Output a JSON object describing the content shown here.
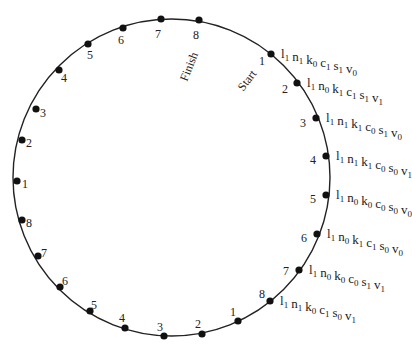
{
  "diagram": {
    "type": "circular-state-sequence",
    "circle": {
      "cx": 171.5,
      "cy": 177.5,
      "r": 158.5,
      "stroke": "#222222"
    },
    "dot_color": "#111111",
    "markers": [
      {
        "text": "Finish",
        "x": 190,
        "y": 67,
        "angle": -68
      },
      {
        "text": "Start",
        "x": 248,
        "y": 81,
        "angle": -52
      }
    ],
    "right_points": [
      {
        "num": "1",
        "x": 271,
        "y": 54,
        "nx": 262,
        "ny": 62,
        "state": [
          [
            "l",
            "1"
          ],
          [
            "n",
            "1"
          ],
          [
            "k",
            "0"
          ],
          [
            "c",
            "1"
          ],
          [
            "s",
            "1"
          ],
          [
            "v",
            "0"
          ]
        ]
      },
      {
        "num": "2",
        "x": 297,
        "y": 83,
        "nx": 285,
        "ny": 90,
        "state": [
          [
            "l",
            "1"
          ],
          [
            "n",
            "0"
          ],
          [
            "k",
            "1"
          ],
          [
            "c",
            "1"
          ],
          [
            "s",
            "1"
          ],
          [
            "v",
            "1"
          ]
        ]
      },
      {
        "num": "3",
        "x": 316,
        "y": 118,
        "nx": 303,
        "ny": 124,
        "state": [
          [
            "l",
            "1"
          ],
          [
            "n",
            "1"
          ],
          [
            "k",
            "1"
          ],
          [
            "c",
            "0"
          ],
          [
            "s",
            "1"
          ],
          [
            "v",
            "0"
          ]
        ]
      },
      {
        "num": "4",
        "x": 326,
        "y": 156,
        "nx": 313,
        "ny": 161,
        "state": [
          [
            "l",
            "1"
          ],
          [
            "n",
            "1"
          ],
          [
            "k",
            "1"
          ],
          [
            "c",
            "0"
          ],
          [
            "s",
            "0"
          ],
          [
            "v",
            "1"
          ]
        ]
      },
      {
        "num": "5",
        "x": 326,
        "y": 195,
        "nx": 313,
        "ny": 200,
        "state": [
          [
            "l",
            "1"
          ],
          [
            "n",
            "0"
          ],
          [
            "k",
            "0"
          ],
          [
            "c",
            "0"
          ],
          [
            "s",
            "0"
          ],
          [
            "v",
            "0"
          ]
        ]
      },
      {
        "num": "6",
        "x": 317,
        "y": 234,
        "nx": 304,
        "ny": 239,
        "state": [
          [
            "l",
            "1"
          ],
          [
            "n",
            "0"
          ],
          [
            "k",
            "1"
          ],
          [
            "c",
            "1"
          ],
          [
            "s",
            "0"
          ],
          [
            "v",
            "0"
          ]
        ]
      },
      {
        "num": "7",
        "x": 299,
        "y": 270,
        "nx": 286,
        "ny": 272,
        "state": [
          [
            "l",
            "1"
          ],
          [
            "n",
            "0"
          ],
          [
            "k",
            "0"
          ],
          [
            "c",
            "0"
          ],
          [
            "s",
            "1"
          ],
          [
            "v",
            "1"
          ]
        ]
      },
      {
        "num": "8",
        "x": 270,
        "y": 301,
        "nx": 262,
        "ny": 295,
        "state": [
          [
            "l",
            "1"
          ],
          [
            "n",
            "1"
          ],
          [
            "k",
            "0"
          ],
          [
            "c",
            "1"
          ],
          [
            "s",
            "0"
          ],
          [
            "v",
            "1"
          ]
        ]
      }
    ],
    "left_points": [
      {
        "num": "1",
        "x": 238,
        "y": 321,
        "nx": 233,
        "ny": 313
      },
      {
        "num": "2",
        "x": 202,
        "y": 334,
        "nx": 198,
        "ny": 325
      },
      {
        "num": "3",
        "x": 164,
        "y": 336,
        "nx": 160,
        "ny": 328
      },
      {
        "num": "4",
        "x": 125,
        "y": 328,
        "nx": 122,
        "ny": 319
      },
      {
        "num": "5",
        "x": 90,
        "y": 311,
        "nx": 94,
        "ny": 306
      },
      {
        "num": "6",
        "x": 60,
        "y": 287,
        "nx": 65,
        "ny": 282
      },
      {
        "num": "7",
        "x": 38,
        "y": 256,
        "nx": 44,
        "ny": 254
      },
      {
        "num": "8",
        "x": 22,
        "y": 220,
        "nx": 29,
        "ny": 224
      },
      {
        "num": "1",
        "x": 17,
        "y": 181,
        "nx": 25,
        "ny": 185
      },
      {
        "num": "2",
        "x": 22,
        "y": 140,
        "nx": 29,
        "ny": 144
      },
      {
        "num": "3",
        "x": 36,
        "y": 109,
        "nx": 43,
        "ny": 114
      },
      {
        "num": "4",
        "x": 59,
        "y": 70,
        "nx": 64,
        "ny": 79
      },
      {
        "num": "5",
        "x": 88,
        "y": 44,
        "nx": 90,
        "ny": 56
      },
      {
        "num": "6",
        "x": 123,
        "y": 28,
        "nx": 121,
        "ny": 41
      },
      {
        "num": "7",
        "x": 161,
        "y": 19,
        "nx": 158,
        "ny": 35
      },
      {
        "num": "8",
        "x": 199,
        "y": 20,
        "nx": 196,
        "ny": 36
      }
    ]
  }
}
